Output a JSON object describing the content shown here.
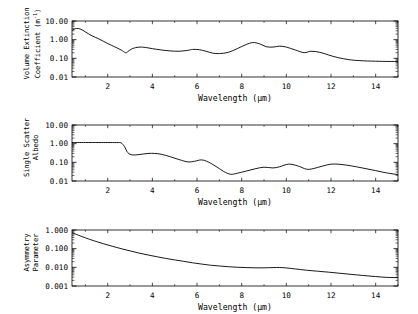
{
  "figure": {
    "background": "#ffffff",
    "line_color": "#000000",
    "axis_color": "#000000",
    "panel_count": 3
  },
  "xaxis": {
    "title": "Wavelength (µm)",
    "ticks": [
      2,
      4,
      6,
      8,
      10,
      12,
      14
    ],
    "tick_labels": [
      "2",
      "4",
      "6",
      "8",
      "10",
      "12",
      "14"
    ],
    "min": 0.4,
    "max": 15.0,
    "scale": "linear"
  },
  "panels": [
    {
      "name": "volume-extinction-coefficient",
      "ylabel_lines": [
        "Volume Extinction",
        "Coefficient (m"
      ],
      "ylabel_sup": "-1",
      "ylabel_tail": ")",
      "ytick_labels": [
        "10.00",
        "1.00",
        "0.10",
        "0.01"
      ]
    },
    {
      "name": "single-scatter-albedo",
      "ylabel_lines": [
        "Single Scatter",
        "Albedo"
      ],
      "ylabel_sup": "",
      "ylabel_tail": "",
      "ytick_labels": [
        "10.00",
        "1.00",
        "0.10",
        "0.01"
      ]
    },
    {
      "name": "asymmetry-parameter",
      "ylabel_lines": [
        "Asymmetry",
        "Parameter"
      ],
      "ylabel_sup": "",
      "ylabel_tail": "",
      "ytick_labels": [
        "1.000",
        "0.100",
        "0.010",
        "0.001"
      ]
    }
  ],
  "chart_data": [
    {
      "type": "line",
      "title": "",
      "xlabel": "Wavelength (µm)",
      "ylabel": "Volume Extinction Coefficient (m^-1)",
      "xscale": "linear",
      "yscale": "log",
      "xlim": [
        0.4,
        15.0
      ],
      "ylim": [
        0.01,
        10.0
      ],
      "yticks": [
        10.0,
        1.0,
        0.1,
        0.01
      ],
      "ytick_labels": [
        "10.00",
        "1.00",
        "0.10",
        "0.01"
      ],
      "xticks": [
        2,
        4,
        6,
        8,
        10,
        12,
        14
      ],
      "grid": false,
      "legend": "none",
      "x": [
        0.4,
        0.6,
        0.8,
        1.0,
        1.3,
        1.6,
        2.0,
        2.3,
        2.6,
        2.8,
        2.9,
        3.1,
        3.4,
        3.7,
        4.0,
        4.4,
        4.8,
        5.2,
        5.6,
        5.8,
        6.1,
        6.4,
        6.7,
        7.0,
        7.4,
        7.8,
        8.2,
        8.5,
        8.8,
        9.1,
        9.4,
        9.7,
        10.0,
        10.4,
        10.8,
        11.1,
        11.5,
        11.9,
        12.3,
        12.8,
        13.3,
        14.0,
        14.6,
        15.0
      ],
      "y": [
        3.2,
        4.0,
        3.6,
        2.6,
        1.6,
        1.1,
        0.62,
        0.42,
        0.28,
        0.2,
        0.23,
        0.33,
        0.4,
        0.38,
        0.33,
        0.28,
        0.25,
        0.24,
        0.27,
        0.3,
        0.29,
        0.24,
        0.19,
        0.18,
        0.21,
        0.33,
        0.55,
        0.7,
        0.6,
        0.42,
        0.4,
        0.45,
        0.4,
        0.28,
        0.2,
        0.24,
        0.21,
        0.15,
        0.11,
        0.085,
        0.075,
        0.07,
        0.068,
        0.068
      ]
    },
    {
      "type": "line",
      "title": "",
      "xlabel": "Wavelength (µm)",
      "ylabel": "Single Scatter Albedo",
      "xscale": "linear",
      "yscale": "log",
      "xlim": [
        0.4,
        15.0
      ],
      "ylim": [
        0.01,
        10.0
      ],
      "yticks": [
        10.0,
        1.0,
        0.1,
        0.01
      ],
      "ytick_labels": [
        "10.00",
        "1.00",
        "0.10",
        "0.01"
      ],
      "xticks": [
        2,
        4,
        6,
        8,
        10,
        12,
        14
      ],
      "grid": false,
      "legend": "none",
      "x": [
        0.4,
        1.0,
        1.6,
        2.0,
        2.4,
        2.6,
        2.75,
        2.9,
        3.1,
        3.4,
        3.8,
        4.1,
        4.4,
        4.8,
        5.2,
        5.6,
        5.9,
        6.2,
        6.5,
        6.9,
        7.2,
        7.5,
        7.8,
        8.2,
        8.6,
        9.0,
        9.4,
        9.7,
        10.1,
        10.5,
        10.9,
        11.2,
        11.6,
        12.0,
        12.4,
        12.9,
        13.4,
        14.0,
        14.5,
        15.0
      ],
      "y": [
        1.15,
        1.15,
        1.15,
        1.15,
        1.14,
        1.1,
        0.7,
        0.33,
        0.25,
        0.26,
        0.3,
        0.3,
        0.27,
        0.2,
        0.14,
        0.105,
        0.115,
        0.135,
        0.105,
        0.055,
        0.032,
        0.023,
        0.026,
        0.034,
        0.045,
        0.055,
        0.05,
        0.058,
        0.08,
        0.065,
        0.043,
        0.046,
        0.062,
        0.08,
        0.078,
        0.065,
        0.05,
        0.036,
        0.027,
        0.022
      ]
    },
    {
      "type": "line",
      "title": "",
      "xlabel": "Wavelength (µm)",
      "ylabel": "Asymmetry Parameter",
      "xscale": "linear",
      "yscale": "log",
      "xlim": [
        0.4,
        15.0
      ],
      "ylim": [
        0.001,
        1.0
      ],
      "yticks": [
        1.0,
        0.1,
        0.01,
        0.001
      ],
      "ytick_labels": [
        "1.000",
        "0.100",
        "0.010",
        "0.001"
      ],
      "xticks": [
        2,
        4,
        6,
        8,
        10,
        12,
        14
      ],
      "grid": false,
      "legend": "none",
      "x": [
        0.4,
        0.7,
        1.0,
        1.4,
        1.8,
        2.2,
        2.6,
        3.0,
        3.4,
        3.8,
        4.2,
        4.6,
        5.0,
        5.4,
        5.8,
        6.2,
        6.6,
        7.0,
        7.4,
        7.8,
        8.2,
        8.6,
        9.0,
        9.4,
        9.7,
        10.0,
        10.4,
        10.9,
        11.4,
        11.9,
        12.4,
        12.9,
        13.4,
        14.0,
        14.5,
        15.0
      ],
      "y": [
        0.72,
        0.52,
        0.38,
        0.26,
        0.185,
        0.135,
        0.1,
        0.076,
        0.058,
        0.046,
        0.037,
        0.03,
        0.025,
        0.021,
        0.0175,
        0.015,
        0.013,
        0.0118,
        0.0108,
        0.0101,
        0.0097,
        0.0094,
        0.0094,
        0.0097,
        0.0098,
        0.0093,
        0.0082,
        0.007,
        0.0062,
        0.0055,
        0.0048,
        0.0042,
        0.0037,
        0.0032,
        0.0029,
        0.0028
      ]
    }
  ]
}
